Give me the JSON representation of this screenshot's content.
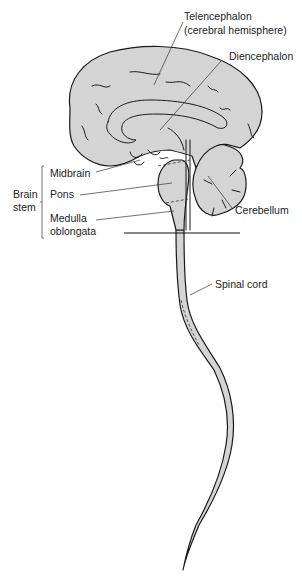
{
  "diagram": {
    "fill_color": "#d4d4d4",
    "stroke_color": "#1a1a1a",
    "labels": {
      "telencephalon_line1": "Telencephalon",
      "telencephalon_line2": "(cerebral hemisphere)",
      "diencephalon": "Diencephalon",
      "midbrain": "Midbrain",
      "pons": "Pons",
      "medulla_line1": "Medulla",
      "medulla_line2": "oblongata",
      "cerebellum": "Cerebellum",
      "spinal_cord": "Spinal cord",
      "brain_stem_line1": "Brain",
      "brain_stem_line2": "stem"
    }
  }
}
